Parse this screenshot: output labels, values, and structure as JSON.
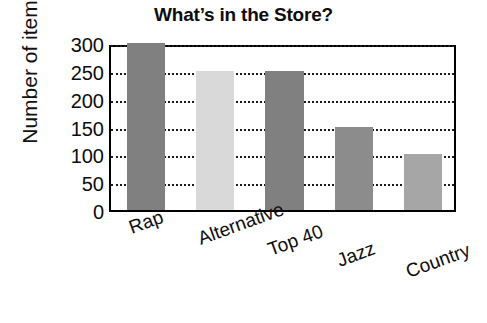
{
  "chart_data": {
    "type": "bar",
    "title": "What’s in the Store?",
    "xlabel": "",
    "ylabel": "Number of item",
    "categories": [
      "Rap",
      "Alternative",
      "Top 40",
      "Jazz",
      "Country"
    ],
    "values": [
      300,
      250,
      250,
      150,
      100
    ],
    "ylim": [
      0,
      300
    ],
    "y_ticks": [
      0,
      50,
      100,
      150,
      200,
      250,
      300
    ],
    "y_tick_labels": [
      "0",
      "50",
      "100",
      "150",
      "200",
      "250",
      "300"
    ],
    "grid": "horizontal-dotted",
    "legend": "none",
    "bar_colors": [
      "#808080",
      "#d9d9d9",
      "#808080",
      "#8c8c8c",
      "#a6a6a6"
    ],
    "series": [
      {
        "name": "Number of item",
        "values": [
          300,
          250,
          250,
          150,
          100
        ]
      }
    ]
  },
  "style": {
    "background": "#ffffff",
    "axis_color": "#000000",
    "gridline_color": "#1a1a1a",
    "text_color": "#0d0d0d"
  }
}
